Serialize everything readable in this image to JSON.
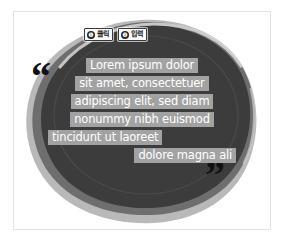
{
  "canvas": {
    "width": 284,
    "height": 242,
    "background": "#ffffff",
    "frame_border_color": "#e2e2e2"
  },
  "graphic": {
    "name": "hand-drawn-blob",
    "layers": [
      {
        "name": "outer-light-blob",
        "color": "#b9b9b9"
      },
      {
        "name": "mid-gray-blob",
        "color": "#6e6e6e"
      },
      {
        "name": "dark-core-blob",
        "color": "#3c3c3c"
      },
      {
        "name": "inner-ring-outline",
        "color": "#4a4a4a"
      }
    ]
  },
  "callouts": [
    {
      "number": "❶",
      "label": "클릭"
    },
    {
      "number": "❷",
      "label": "입력"
    }
  ],
  "quote_marks": {
    "open": "“",
    "close": "”",
    "color": "#111111"
  },
  "quote": {
    "highlight_color": "#a2a2a2",
    "text_color": "#ffffff",
    "lines": [
      {
        "text": "Lorem ipsum dolor",
        "align": "center"
      },
      {
        "text": "sit amet, consectetuer",
        "align": "center"
      },
      {
        "text": "adipiscing elit, sed diam",
        "align": "center"
      },
      {
        "text": "nonummy nibh euismod",
        "align": "center"
      },
      {
        "text": "tincidunt ut laoreet",
        "align": "left"
      },
      {
        "text": "dolore magna ali",
        "align": "right"
      }
    ]
  }
}
